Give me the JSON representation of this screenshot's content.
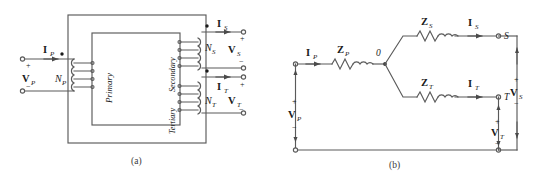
{
  "figure": {
    "type": "three-winding-transformer-schematic",
    "captions": {
      "a": "(a)",
      "b": "(b)"
    },
    "colors": {
      "line": "#5a5a5a",
      "text": "#1a1a1a",
      "background": "#ffffff"
    }
  },
  "panel_a": {
    "name": "physical-transformer-diagram",
    "core_label_primary": "Primary",
    "core_label_secondary": "Secondary",
    "core_label_tertiary": "Tertiary",
    "primary": {
      "current_label": "I",
      "current_sub": "P",
      "voltage_label": "V",
      "voltage_sub": "P",
      "turns_label": "N",
      "turns_sub": "P",
      "plus": "+",
      "minus": "−",
      "turns_count": 4
    },
    "secondary": {
      "current_label": "I",
      "current_sub": "S",
      "voltage_label": "V",
      "voltage_sub": "S",
      "turns_label": "N",
      "turns_sub": "S",
      "plus": "+",
      "minus": "−",
      "turns_count": 4
    },
    "tertiary": {
      "current_label": "I",
      "current_sub": "T",
      "voltage_label": "V",
      "voltage_sub": "T",
      "turns_label": "N",
      "turns_sub": "T",
      "plus": "+",
      "minus": "−",
      "turns_count": 4
    }
  },
  "panel_b": {
    "name": "equivalent-circuit-diagram",
    "node_label": "0",
    "terminal_s": "S",
    "terminal_t": "T",
    "primary_branch": {
      "impedance_label": "Z",
      "impedance_sub": "P",
      "current_label": "I",
      "current_sub": "P",
      "voltage_label": "V",
      "voltage_sub": "P",
      "plus": "+",
      "minus": "−"
    },
    "secondary_branch": {
      "impedance_label": "Z",
      "impedance_sub": "S",
      "current_label": "I",
      "current_sub": "S",
      "voltage_label": "V",
      "voltage_sub": "S",
      "plus": "+",
      "minus": "−"
    },
    "tertiary_branch": {
      "impedance_label": "Z",
      "impedance_sub": "T",
      "current_label": "I",
      "current_sub": "T",
      "voltage_label": "V",
      "voltage_sub": "T",
      "plus": "+",
      "minus": "−"
    }
  }
}
